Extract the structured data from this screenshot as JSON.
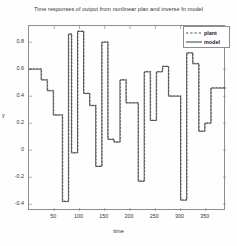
{
  "chart_data": {
    "type": "line",
    "title": "Time responses of output from nonlinear plan and inverse fn model",
    "xlabel": "time",
    "ylabel": "y",
    "xlim": [
      0,
      390
    ],
    "ylim": [
      -0.45,
      0.92
    ],
    "xticks": [
      50,
      100,
      150,
      200,
      250,
      300,
      350
    ],
    "xtick_labels": [
      "50",
      "100",
      "150",
      "200",
      "250",
      "300",
      "350"
    ],
    "yticks": [
      0.8,
      0.6,
      0.4,
      0.2,
      0,
      -0.2,
      -0.4
    ],
    "ytick_labels": [
      "0.8",
      "0.6",
      "0.4",
      "0.2",
      "0",
      "-0.2",
      "-0.4"
    ],
    "grid": false,
    "legend_position": "upper right",
    "step_style": "post",
    "series": [
      {
        "name": "plant",
        "style": "dashed",
        "color": "#555555",
        "x": [
          0,
          12,
          24,
          36,
          48,
          60,
          66,
          78,
          84,
          96,
          108,
          120,
          132,
          144,
          156,
          168,
          180,
          192,
          204,
          216,
          228,
          240,
          252,
          264,
          276,
          288,
          300,
          312,
          324,
          336,
          348,
          360,
          372,
          384,
          390
        ],
        "values": [
          0.6,
          0.6,
          0.52,
          0.44,
          0.26,
          0.26,
          -0.38,
          0.86,
          -0.02,
          0.88,
          0.42,
          0.33,
          -0.12,
          0.8,
          0.08,
          0.06,
          0.52,
          0.35,
          0.35,
          -0.23,
          0.58,
          0.22,
          0.58,
          0.62,
          0.4,
          0.4,
          -0.37,
          0.72,
          0.64,
          0.14,
          0.2,
          0.46,
          0.46,
          0.46,
          0.46
        ]
      },
      {
        "name": "model",
        "style": "solid",
        "color": "#3a3a3a",
        "x": [
          0,
          12,
          24,
          36,
          48,
          60,
          66,
          78,
          84,
          96,
          108,
          120,
          132,
          144,
          156,
          168,
          180,
          192,
          204,
          216,
          228,
          240,
          252,
          264,
          276,
          288,
          300,
          312,
          324,
          336,
          348,
          360,
          372,
          384,
          390
        ],
        "values": [
          0.6,
          0.6,
          0.52,
          0.44,
          0.26,
          0.26,
          -0.38,
          0.86,
          -0.02,
          0.88,
          0.42,
          0.33,
          -0.12,
          0.8,
          0.08,
          0.06,
          0.52,
          0.35,
          0.35,
          -0.23,
          0.58,
          0.22,
          0.58,
          0.62,
          0.4,
          0.4,
          -0.37,
          0.72,
          0.64,
          0.14,
          0.2,
          0.46,
          0.46,
          0.46,
          0.46
        ]
      }
    ]
  },
  "legend": {
    "items": [
      {
        "label": "plant"
      },
      {
        "label": "model"
      }
    ]
  }
}
